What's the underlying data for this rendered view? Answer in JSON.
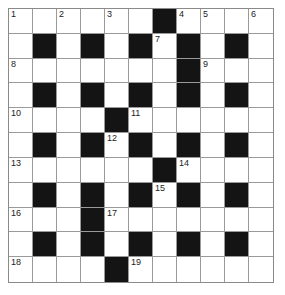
{
  "puzzle": {
    "type": "crossword",
    "rows": 11,
    "cols": 11,
    "colors": {
      "block": "#141414",
      "cell": "#ffffff",
      "line": "#9a9a9a"
    },
    "grid": [
      "......#....",
      ".#.#.#.#.#.",
      ".......#...",
      ".#.#.#.#.#.",
      "....#......",
      ".#.#.#.#.#.",
      "......#....",
      ".#.#.#.#.#.",
      "...#.......",
      ".#.#.#.#.#.",
      "....#......"
    ],
    "numbers": [
      {
        "row": 0,
        "col": 0,
        "n": "1"
      },
      {
        "row": 0,
        "col": 2,
        "n": "2"
      },
      {
        "row": 0,
        "col": 4,
        "n": "3"
      },
      {
        "row": 0,
        "col": 7,
        "n": "4"
      },
      {
        "row": 0,
        "col": 8,
        "n": "5"
      },
      {
        "row": 0,
        "col": 10,
        "n": "6"
      },
      {
        "row": 1,
        "col": 6,
        "n": "7"
      },
      {
        "row": 2,
        "col": 0,
        "n": "8"
      },
      {
        "row": 2,
        "col": 8,
        "n": "9"
      },
      {
        "row": 4,
        "col": 0,
        "n": "10"
      },
      {
        "row": 4,
        "col": 5,
        "n": "11"
      },
      {
        "row": 5,
        "col": 4,
        "n": "12"
      },
      {
        "row": 6,
        "col": 0,
        "n": "13"
      },
      {
        "row": 6,
        "col": 7,
        "n": "14"
      },
      {
        "row": 7,
        "col": 6,
        "n": "15"
      },
      {
        "row": 8,
        "col": 0,
        "n": "16"
      },
      {
        "row": 8,
        "col": 4,
        "n": "17"
      },
      {
        "row": 10,
        "col": 0,
        "n": "18"
      },
      {
        "row": 10,
        "col": 5,
        "n": "19"
      }
    ]
  }
}
